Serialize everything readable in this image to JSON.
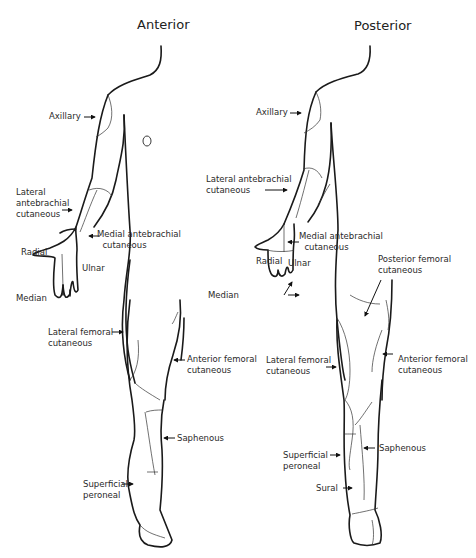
{
  "figure": {
    "panels": [
      {
        "id": "anterior",
        "title": "Anterior",
        "labels": [
          {
            "key": "axillary",
            "text": "Axillary"
          },
          {
            "key": "lateral-antebrachial",
            "text": "Lateral\nantebrachial\ncutaneous"
          },
          {
            "key": "medial-antebrachial",
            "text": "Medial antebrachial\n  cutaneous"
          },
          {
            "key": "radial",
            "text": "Radial"
          },
          {
            "key": "ulnar",
            "text": "Ulnar"
          },
          {
            "key": "median",
            "text": "Median"
          },
          {
            "key": "lateral-femoral",
            "text": "Lateral femoral\ncutaneous"
          },
          {
            "key": "anterior-femoral",
            "text": "Anterior femoral\ncutaneous"
          },
          {
            "key": "saphenous",
            "text": "Saphenous"
          },
          {
            "key": "superficial-peroneal",
            "text": "Superficial\nperoneal"
          }
        ]
      },
      {
        "id": "posterior",
        "title": "Posterior",
        "labels": [
          {
            "key": "axillary",
            "text": "Axillary"
          },
          {
            "key": "lateral-antebrachial",
            "text": "Lateral antebrachial\ncutaneous"
          },
          {
            "key": "medial-antebrachial",
            "text": "Medial antebrachial\n  cutaneous"
          },
          {
            "key": "radial",
            "text": "Radial"
          },
          {
            "key": "ulnar",
            "text": "Ulnar"
          },
          {
            "key": "median",
            "text": "Median"
          },
          {
            "key": "posterior-femoral",
            "text": "Posterior femoral\ncutaneous"
          },
          {
            "key": "lateral-femoral",
            "text": "Lateral femoral\ncutaneous"
          },
          {
            "key": "anterior-femoral",
            "text": "Anterior femoral\ncutaneous"
          },
          {
            "key": "superficial-peroneal",
            "text": "Superficial\nperoneal"
          },
          {
            "key": "saphenous",
            "text": "Saphenous"
          },
          {
            "key": "sural",
            "text": "Sural"
          }
        ]
      }
    ]
  }
}
